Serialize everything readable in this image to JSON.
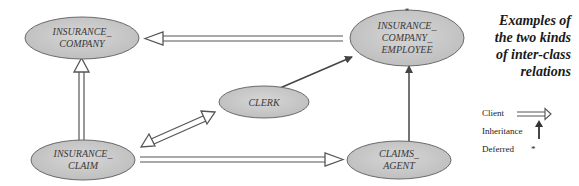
{
  "caption": {
    "line1": "Examples of",
    "line2": "the two kinds",
    "line3": "of inter-class",
    "line4": "relations"
  },
  "nodes": {
    "insurance_company": {
      "line1": "INSURANCE_",
      "line2": "COMPANY"
    },
    "insurance_company_employee": {
      "line1": "INSURANCE_",
      "line2": "COMPANY_",
      "line3": "EMPLOYEE",
      "deferred_marker": "*"
    },
    "clerk": {
      "line1": "CLERK"
    },
    "insurance_claim": {
      "line1": "INSURANCE_",
      "line2": "CLAIM"
    },
    "claims_agent": {
      "line1": "CLAIMS_",
      "line2": "AGENT"
    }
  },
  "legend": {
    "client": "Client",
    "inheritance": "Inheritance",
    "deferred": "Deferred",
    "deferred_symbol": "*"
  },
  "relations": [
    {
      "from": "INSURANCE_COMPANY_EMPLOYEE",
      "to": "INSURANCE_COMPANY",
      "kind": "client"
    },
    {
      "from": "INSURANCE_CLAIM",
      "to": "INSURANCE_COMPANY",
      "kind": "client"
    },
    {
      "from": "CLERK",
      "to": "INSURANCE_CLAIM",
      "kind": "client"
    },
    {
      "from": "INSURANCE_CLAIM",
      "to": "CLERK",
      "kind": "client"
    },
    {
      "from": "INSURANCE_CLAIM",
      "to": "CLAIMS_AGENT",
      "kind": "client"
    },
    {
      "from": "CLERK",
      "to": "INSURANCE_COMPANY_EMPLOYEE",
      "kind": "inheritance"
    },
    {
      "from": "CLAIMS_AGENT",
      "to": "INSURANCE_COMPANY_EMPLOYEE",
      "kind": "inheritance"
    }
  ],
  "colors": {
    "node_fill": "#c8c8c8",
    "node_stroke": "#6a6a6a",
    "arrow": "#555555",
    "text": "#3a3a3a"
  }
}
